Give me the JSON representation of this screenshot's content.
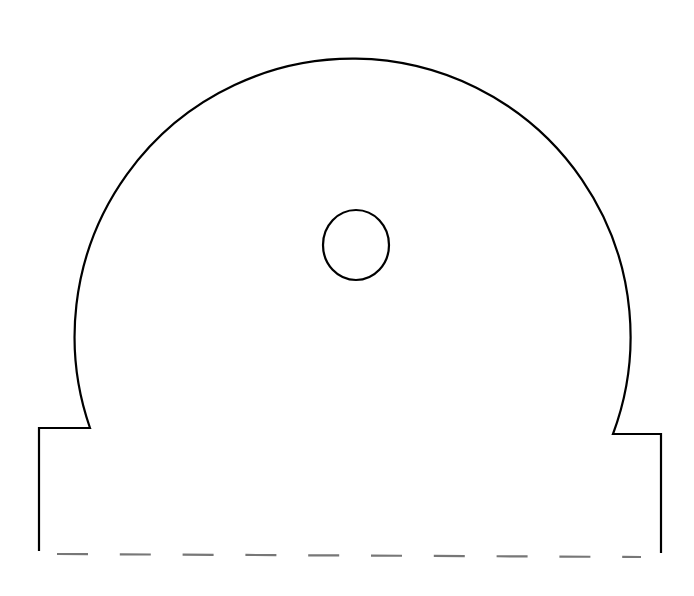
{
  "diagram": {
    "type": "template-outline",
    "canvas": {
      "width": 694,
      "height": 596,
      "background": "#ffffff"
    },
    "stroke_color": "#000000",
    "dash_color": "#777777",
    "outline": {
      "left_base": {
        "x": 39,
        "top_y": 428,
        "bottom_y": 551
      },
      "left_notch": {
        "from_x": 39,
        "to_x": 90,
        "y": 428
      },
      "arc": {
        "start": [
          90,
          428
        ],
        "end": [
          613,
          434
        ],
        "top_y": 54,
        "center_x": 356,
        "radius": 278
      },
      "right_notch": {
        "from_x": 613,
        "to_x": 661,
        "y": 434
      },
      "right_base": {
        "x": 661,
        "top_y": 434,
        "bottom_y": 553
      }
    },
    "hole": {
      "cx": 356,
      "cy": 245,
      "rx": 33,
      "ry": 35
    },
    "fold_line": {
      "style": "dashed",
      "x1": 57,
      "y1": 554,
      "x2": 641,
      "y2": 557,
      "dash_count": 10
    }
  }
}
